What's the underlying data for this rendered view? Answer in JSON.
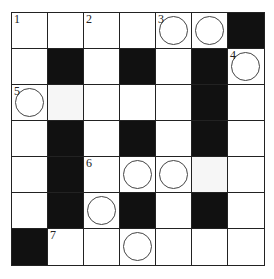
{
  "puzzle": {
    "rows": 7,
    "cols": 7,
    "colors": {
      "black": "#111111",
      "white": "#ffffff",
      "line": "#222222"
    },
    "cells": [
      [
        {
          "t": "w",
          "n": "1"
        },
        {
          "t": "w"
        },
        {
          "t": "w",
          "n": "2"
        },
        {
          "t": "w"
        },
        {
          "t": "w",
          "n": "3",
          "c": true
        },
        {
          "t": "w",
          "c": true
        },
        {
          "t": "b"
        }
      ],
      [
        {
          "t": "w"
        },
        {
          "t": "b"
        },
        {
          "t": "w"
        },
        {
          "t": "b"
        },
        {
          "t": "w"
        },
        {
          "t": "b"
        },
        {
          "t": "w",
          "n": "4",
          "c": true
        }
      ],
      [
        {
          "t": "w",
          "n": "5",
          "c": true
        },
        {
          "t": "s"
        },
        {
          "t": "w"
        },
        {
          "t": "w"
        },
        {
          "t": "w"
        },
        {
          "t": "b"
        },
        {
          "t": "w"
        }
      ],
      [
        {
          "t": "w"
        },
        {
          "t": "b"
        },
        {
          "t": "w"
        },
        {
          "t": "b"
        },
        {
          "t": "w"
        },
        {
          "t": "b"
        },
        {
          "t": "w"
        }
      ],
      [
        {
          "t": "w"
        },
        {
          "t": "b"
        },
        {
          "t": "w",
          "n": "6"
        },
        {
          "t": "w",
          "c": true
        },
        {
          "t": "w",
          "c": true
        },
        {
          "t": "s"
        },
        {
          "t": "w"
        }
      ],
      [
        {
          "t": "w"
        },
        {
          "t": "b"
        },
        {
          "t": "w",
          "c": true
        },
        {
          "t": "b"
        },
        {
          "t": "w"
        },
        {
          "t": "b"
        },
        {
          "t": "w"
        }
      ],
      [
        {
          "t": "b"
        },
        {
          "t": "w",
          "n": "7"
        },
        {
          "t": "w"
        },
        {
          "t": "w",
          "c": true
        },
        {
          "t": "w"
        },
        {
          "t": "w"
        },
        {
          "t": "w"
        }
      ]
    ]
  }
}
